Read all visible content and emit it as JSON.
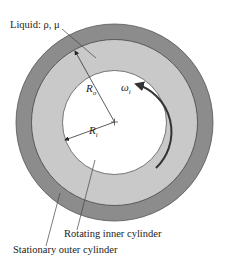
{
  "diagram": {
    "type": "concentric-cylinders",
    "labels": {
      "liquid": "Liquid: ρ, μ",
      "outer_radius_symbol": "R",
      "outer_radius_sub": "o",
      "inner_radius_symbol": "R",
      "inner_radius_sub": "i",
      "omega_symbol": "ω",
      "omega_sub": "i",
      "inner_cylinder": "Rotating inner cylinder",
      "outer_cylinder": "Stationary outer cylinder"
    },
    "colors": {
      "outer_wall": "#8c8c8c",
      "liquid": "#c9c9c9",
      "inner_cylinder": "#ffffff",
      "lines": "#333333"
    }
  }
}
